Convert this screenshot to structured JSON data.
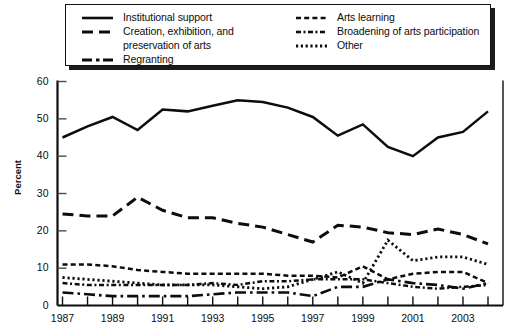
{
  "legend": {
    "columns": [
      {
        "entries": [
          {
            "style": "solid",
            "label": "Institutional support",
            "label2": ""
          },
          {
            "style": "dash",
            "label": "Creation, exhibition, and",
            "label2": "preservation of arts"
          },
          {
            "style": "dashdot",
            "label": "Regranting",
            "label2": ""
          }
        ]
      },
      {
        "entries": [
          {
            "style": "smalldash",
            "label": "Arts learning",
            "label2": ""
          },
          {
            "style": "dotdash",
            "label": "Broadening of arts participation",
            "label2": ""
          },
          {
            "style": "dotted",
            "label": "Other",
            "label2": ""
          }
        ]
      }
    ]
  },
  "chart_data": {
    "type": "line",
    "title": "",
    "xlabel": "",
    "ylabel": "Percent",
    "ylim": [
      0,
      60
    ],
    "yticks": [
      0,
      10,
      20,
      30,
      40,
      50,
      60
    ],
    "xlim": [
      1987,
      2004
    ],
    "x": [
      1987,
      1988,
      1989,
      1990,
      1991,
      1992,
      1993,
      1994,
      1995,
      1996,
      1997,
      1998,
      1999,
      2000,
      2001,
      2002,
      2003,
      2004
    ],
    "xticks": [
      1987,
      1988,
      1989,
      1990,
      1991,
      1992,
      1993,
      1994,
      1995,
      1996,
      1997,
      1998,
      1999,
      2000,
      2001,
      2002,
      2003,
      2004
    ],
    "xtick_labels": [
      "1987",
      "",
      "1989",
      "",
      "1991",
      "",
      "1993",
      "",
      "1995",
      "",
      "1997",
      "",
      "1999",
      "",
      "2001",
      "",
      "2003",
      ""
    ],
    "grid": false,
    "legend_position": "above-plot",
    "series": [
      {
        "name": "Institutional support",
        "style": "solid",
        "values": [
          45.0,
          48.0,
          50.5,
          47.0,
          52.5,
          52.0,
          53.5,
          55.0,
          54.5,
          53.0,
          50.5,
          45.5,
          48.5,
          42.5,
          40.0,
          45.0,
          46.5,
          52.0
        ]
      },
      {
        "name": "Creation, exhibition, and preservation of arts",
        "style": "dash",
        "values": [
          24.5,
          24.0,
          24.0,
          29.0,
          25.5,
          23.5,
          23.5,
          22.0,
          21.0,
          19.0,
          17.0,
          21.5,
          21.0,
          19.5,
          19.0,
          20.5,
          19.0,
          16.5
        ]
      },
      {
        "name": "Regranting",
        "style": "dashdot",
        "values": [
          3.5,
          3.0,
          2.5,
          2.5,
          2.5,
          2.5,
          3.0,
          3.5,
          3.5,
          3.5,
          2.5,
          5.0,
          5.0,
          7.0,
          6.0,
          5.5,
          4.5,
          6.0
        ]
      },
      {
        "name": "Arts learning",
        "style": "smalldash",
        "values": [
          11.0,
          11.0,
          10.5,
          9.5,
          9.0,
          8.5,
          8.5,
          8.5,
          8.5,
          8.0,
          8.0,
          7.5,
          10.5,
          7.0,
          8.5,
          9.0,
          9.0,
          6.0
        ]
      },
      {
        "name": "Broadening of arts participation",
        "style": "dotdash",
        "values": [
          6.0,
          5.5,
          5.5,
          5.5,
          5.5,
          5.5,
          6.0,
          5.5,
          6.5,
          6.5,
          7.0,
          7.0,
          7.0,
          6.0,
          5.0,
          4.5,
          5.0,
          5.5
        ]
      },
      {
        "name": "Other",
        "style": "dotted",
        "values": [
          7.5,
          7.0,
          6.5,
          6.0,
          5.5,
          5.5,
          5.5,
          5.0,
          4.5,
          5.0,
          7.0,
          9.0,
          6.0,
          17.5,
          12.0,
          13.0,
          13.0,
          11.0
        ]
      }
    ]
  }
}
